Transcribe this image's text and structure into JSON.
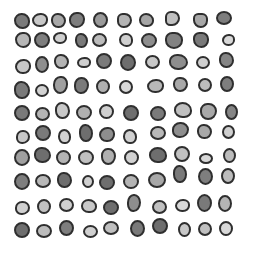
{
  "image": {
    "width": 253,
    "height": 256,
    "background": "#ffffff",
    "outline_color": "#2f2f2f",
    "description": "Grid of irregular rounded grayscale blobs with dark outlines"
  },
  "blobs": [
    {
      "x": 22,
      "y": 21,
      "w": 16,
      "h": 16,
      "fill": "#7a7a7a",
      "r": "48% 52% 45% 55%"
    },
    {
      "x": 40,
      "y": 20,
      "w": 16,
      "h": 14,
      "fill": "#c8c8c8",
      "r": "55% 45% 50% 50%"
    },
    {
      "x": 58,
      "y": 20,
      "w": 15,
      "h": 15,
      "fill": "#a8a8a8",
      "r": "45% 55% 50% 50%"
    },
    {
      "x": 77,
      "y": 20,
      "w": 16,
      "h": 16,
      "fill": "#7e7e7e",
      "r": "50% 45% 55% 50%"
    },
    {
      "x": 100,
      "y": 20,
      "w": 15,
      "h": 16,
      "fill": "#9a9a9a",
      "r": "50%"
    },
    {
      "x": 124,
      "y": 20,
      "w": 15,
      "h": 15,
      "fill": "#b4b4b4",
      "r": "40% 50% 55% 45%"
    },
    {
      "x": 146,
      "y": 20,
      "w": 15,
      "h": 14,
      "fill": "#a5a5a5",
      "r": "50% 55% 45% 50%"
    },
    {
      "x": 172,
      "y": 18,
      "w": 15,
      "h": 15,
      "fill": "#c0c0c0",
      "r": "45% 55% 60% 40%"
    },
    {
      "x": 200,
      "y": 20,
      "w": 15,
      "h": 15,
      "fill": "#a8a8a8",
      "r": "40% 45% 55% 60%"
    },
    {
      "x": 224,
      "y": 18,
      "w": 16,
      "h": 14,
      "fill": "#7d7d7d",
      "r": "50%"
    },
    {
      "x": 23,
      "y": 40,
      "w": 16,
      "h": 16,
      "fill": "#b6b6b6",
      "r": "50% 45% 50% 55%"
    },
    {
      "x": 42,
      "y": 40,
      "w": 16,
      "h": 16,
      "fill": "#7f7f7f",
      "r": "50%"
    },
    {
      "x": 60,
      "y": 38,
      "w": 14,
      "h": 12,
      "fill": "#cfcfcf",
      "r": "55% 45% 50% 50%"
    },
    {
      "x": 81,
      "y": 40,
      "w": 13,
      "h": 15,
      "fill": "#7a7a7a",
      "r": "45% 55% 50% 50%"
    },
    {
      "x": 99,
      "y": 40,
      "w": 15,
      "h": 14,
      "fill": "#bcbcbc",
      "r": "50%"
    },
    {
      "x": 126,
      "y": 40,
      "w": 14,
      "h": 14,
      "fill": "#d0d0d0",
      "r": "50% 50% 45% 55%"
    },
    {
      "x": 149,
      "y": 40,
      "w": 16,
      "h": 15,
      "fill": "#8e8e8e",
      "r": "50%"
    },
    {
      "x": 174,
      "y": 40,
      "w": 18,
      "h": 17,
      "fill": "#828282",
      "r": "40% 45% 50% 50%"
    },
    {
      "x": 201,
      "y": 40,
      "w": 16,
      "h": 16,
      "fill": "#7a7a7a",
      "r": "45% 50% 55% 60%"
    },
    {
      "x": 228,
      "y": 40,
      "w": 13,
      "h": 12,
      "fill": "#d8d8d8",
      "r": "55% 45% 50% 50%"
    },
    {
      "x": 23,
      "y": 66,
      "w": 16,
      "h": 15,
      "fill": "#c8c8c8",
      "r": "55% 45% 50% 50%"
    },
    {
      "x": 42,
      "y": 64,
      "w": 14,
      "h": 17,
      "fill": "#8e8e8e",
      "r": "50%"
    },
    {
      "x": 61,
      "y": 61,
      "w": 15,
      "h": 15,
      "fill": "#b4b4b4",
      "r": "45% 55% 50% 50%"
    },
    {
      "x": 84,
      "y": 62,
      "w": 14,
      "h": 11,
      "fill": "#cfcfcf",
      "r": "55% 45% 50% 50%"
    },
    {
      "x": 104,
      "y": 61,
      "w": 16,
      "h": 16,
      "fill": "#7a7a7a",
      "r": "50%"
    },
    {
      "x": 128,
      "y": 62,
      "w": 16,
      "h": 17,
      "fill": "#6e6e6e",
      "r": "50%"
    },
    {
      "x": 152,
      "y": 62,
      "w": 15,
      "h": 14,
      "fill": "#c8c8c8",
      "r": "50%"
    },
    {
      "x": 178,
      "y": 62,
      "w": 19,
      "h": 16,
      "fill": "#8e8e8e",
      "r": "45% 55% 50% 50%"
    },
    {
      "x": 203,
      "y": 62,
      "w": 14,
      "h": 13,
      "fill": "#cfcfcf",
      "r": "50%"
    },
    {
      "x": 226,
      "y": 60,
      "w": 15,
      "h": 16,
      "fill": "#858585",
      "r": "45% 55% 50% 50%"
    },
    {
      "x": 22,
      "y": 90,
      "w": 16,
      "h": 18,
      "fill": "#7a7a7a",
      "r": "45% 55% 50% 50%"
    },
    {
      "x": 42,
      "y": 90,
      "w": 14,
      "h": 13,
      "fill": "#d2d2d2",
      "r": "50%"
    },
    {
      "x": 60,
      "y": 85,
      "w": 15,
      "h": 18,
      "fill": "#a0a0a0",
      "r": "50% 45% 55% 50%"
    },
    {
      "x": 81,
      "y": 85,
      "w": 15,
      "h": 17,
      "fill": "#7a7a7a",
      "r": "50% 50% 55% 45%"
    },
    {
      "x": 103,
      "y": 86,
      "w": 14,
      "h": 15,
      "fill": "#b0b0b0",
      "r": "50%"
    },
    {
      "x": 126,
      "y": 87,
      "w": 14,
      "h": 14,
      "fill": "#d8d8d8",
      "r": "50%"
    },
    {
      "x": 155,
      "y": 86,
      "w": 17,
      "h": 14,
      "fill": "#b8b8b8",
      "r": "55% 45% 50% 50%"
    },
    {
      "x": 180,
      "y": 84,
      "w": 15,
      "h": 15,
      "fill": "#a8a8a8",
      "r": "45% 50% 55% 50%"
    },
    {
      "x": 205,
      "y": 85,
      "w": 14,
      "h": 14,
      "fill": "#bcbcbc",
      "r": "50%"
    },
    {
      "x": 227,
      "y": 84,
      "w": 14,
      "h": 16,
      "fill": "#7e7e7e",
      "r": "50%"
    },
    {
      "x": 22,
      "y": 113,
      "w": 16,
      "h": 16,
      "fill": "#7a7a7a",
      "r": "50%"
    },
    {
      "x": 42,
      "y": 114,
      "w": 15,
      "h": 14,
      "fill": "#b4b4b4",
      "r": "50%"
    },
    {
      "x": 62,
      "y": 110,
      "w": 15,
      "h": 17,
      "fill": "#c8c8c8",
      "r": "45% 55% 50% 50%"
    },
    {
      "x": 84,
      "y": 112,
      "w": 16,
      "h": 15,
      "fill": "#b0b0b0",
      "r": "50%"
    },
    {
      "x": 106,
      "y": 111,
      "w": 15,
      "h": 15,
      "fill": "#d0d0d0",
      "r": "50%"
    },
    {
      "x": 131,
      "y": 113,
      "w": 16,
      "h": 16,
      "fill": "#6e6e6e",
      "r": "50%"
    },
    {
      "x": 158,
      "y": 113,
      "w": 16,
      "h": 15,
      "fill": "#7a7a7a",
      "r": "50%"
    },
    {
      "x": 183,
      "y": 110,
      "w": 18,
      "h": 16,
      "fill": "#c0c0c0",
      "r": "50% 55% 45% 50%"
    },
    {
      "x": 208,
      "y": 111,
      "w": 17,
      "h": 17,
      "fill": "#a8a8a8",
      "r": "45% 50% 55% 50%"
    },
    {
      "x": 231,
      "y": 112,
      "w": 13,
      "h": 16,
      "fill": "#858585",
      "r": "50%"
    },
    {
      "x": 23,
      "y": 137,
      "w": 14,
      "h": 14,
      "fill": "#c8c8c8",
      "r": "50% 50% 55% 45%"
    },
    {
      "x": 43,
      "y": 133,
      "w": 16,
      "h": 16,
      "fill": "#7a7a7a",
      "r": "50%"
    },
    {
      "x": 64,
      "y": 136,
      "w": 13,
      "h": 15,
      "fill": "#d2d2d2",
      "r": "50% 55% 45% 50%"
    },
    {
      "x": 86,
      "y": 133,
      "w": 14,
      "h": 18,
      "fill": "#6e6e6e",
      "r": "45% 55% 50% 50%"
    },
    {
      "x": 107,
      "y": 134,
      "w": 16,
      "h": 15,
      "fill": "#8e8e8e",
      "r": "55% 45% 50% 50%"
    },
    {
      "x": 130,
      "y": 136,
      "w": 14,
      "h": 15,
      "fill": "#d0d0d0",
      "r": "50% 55% 45% 50%"
    },
    {
      "x": 158,
      "y": 133,
      "w": 16,
      "h": 14,
      "fill": "#b8b8b8",
      "r": "50%"
    },
    {
      "x": 180,
      "y": 130,
      "w": 17,
      "h": 16,
      "fill": "#8e8e8e",
      "r": "50% 50% 55% 45%"
    },
    {
      "x": 204,
      "y": 131,
      "w": 15,
      "h": 15,
      "fill": "#a8a8a8",
      "r": "45% 55% 50% 50%"
    },
    {
      "x": 228,
      "y": 132,
      "w": 13,
      "h": 14,
      "fill": "#cfcfcf",
      "r": "50%"
    },
    {
      "x": 22,
      "y": 157,
      "w": 16,
      "h": 17,
      "fill": "#a0a0a0",
      "r": "50%"
    },
    {
      "x": 42,
      "y": 155,
      "w": 17,
      "h": 16,
      "fill": "#6e6e6e",
      "r": "45% 55% 50% 50%"
    },
    {
      "x": 63,
      "y": 157,
      "w": 15,
      "h": 15,
      "fill": "#b4b4b4",
      "r": "50%"
    },
    {
      "x": 86,
      "y": 157,
      "w": 16,
      "h": 15,
      "fill": "#c0c0c0",
      "r": "50%"
    },
    {
      "x": 108,
      "y": 156,
      "w": 15,
      "h": 17,
      "fill": "#b0b0b0",
      "r": "45% 50% 55% 50%"
    },
    {
      "x": 131,
      "y": 157,
      "w": 15,
      "h": 15,
      "fill": "#d2d2d2",
      "r": "50%"
    },
    {
      "x": 158,
      "y": 155,
      "w": 18,
      "h": 16,
      "fill": "#6e6e6e",
      "r": "50% 55% 45% 50%"
    },
    {
      "x": 182,
      "y": 154,
      "w": 16,
      "h": 16,
      "fill": "#c0c0c0",
      "r": "50%"
    },
    {
      "x": 206,
      "y": 158,
      "w": 14,
      "h": 11,
      "fill": "#d8d8d8",
      "r": "50%"
    },
    {
      "x": 229,
      "y": 155,
      "w": 13,
      "h": 15,
      "fill": "#bcbcbc",
      "r": "50%"
    },
    {
      "x": 22,
      "y": 181,
      "w": 16,
      "h": 17,
      "fill": "#7e7e7e",
      "r": "50%"
    },
    {
      "x": 43,
      "y": 181,
      "w": 16,
      "h": 14,
      "fill": "#b8b8b8",
      "r": "50%"
    },
    {
      "x": 64,
      "y": 180,
      "w": 15,
      "h": 16,
      "fill": "#6e6e6e",
      "r": "45% 55% 50% 50%"
    },
    {
      "x": 88,
      "y": 181,
      "w": 12,
      "h": 13,
      "fill": "#d0d0d0",
      "r": "50%"
    },
    {
      "x": 107,
      "y": 182,
      "w": 16,
      "h": 15,
      "fill": "#6e6e6e",
      "r": "50%"
    },
    {
      "x": 131,
      "y": 181,
      "w": 16,
      "h": 15,
      "fill": "#b4b4b4",
      "r": "50%"
    },
    {
      "x": 157,
      "y": 180,
      "w": 18,
      "h": 16,
      "fill": "#a8a8a8",
      "r": "50%"
    },
    {
      "x": 180,
      "y": 174,
      "w": 14,
      "h": 18,
      "fill": "#7a7a7a",
      "r": "45% 55% 50% 50%"
    },
    {
      "x": 205,
      "y": 176,
      "w": 15,
      "h": 17,
      "fill": "#7e7e7e",
      "r": "50%"
    },
    {
      "x": 228,
      "y": 176,
      "w": 14,
      "h": 16,
      "fill": "#bcbcbc",
      "r": "50%"
    },
    {
      "x": 22,
      "y": 208,
      "w": 15,
      "h": 14,
      "fill": "#d0d0d0",
      "r": "50% 50% 55% 45%"
    },
    {
      "x": 44,
      "y": 206,
      "w": 14,
      "h": 15,
      "fill": "#c0c0c0",
      "r": "50%"
    },
    {
      "x": 66,
      "y": 205,
      "w": 15,
      "h": 14,
      "fill": "#cfcfcf",
      "r": "50%"
    },
    {
      "x": 89,
      "y": 206,
      "w": 16,
      "h": 14,
      "fill": "#c8c8c8",
      "r": "50% 55% 45% 50%"
    },
    {
      "x": 111,
      "y": 207,
      "w": 16,
      "h": 15,
      "fill": "#6e6e6e",
      "r": "50%"
    },
    {
      "x": 134,
      "y": 203,
      "w": 14,
      "h": 18,
      "fill": "#8e8e8e",
      "r": "50% 50% 55% 45%"
    },
    {
      "x": 159,
      "y": 207,
      "w": 15,
      "h": 14,
      "fill": "#c0c0c0",
      "r": "50%"
    },
    {
      "x": 182,
      "y": 205,
      "w": 15,
      "h": 13,
      "fill": "#d8d8d8",
      "r": "55% 45% 50% 50%"
    },
    {
      "x": 204,
      "y": 203,
      "w": 15,
      "h": 18,
      "fill": "#7a7a7a",
      "r": "50%"
    },
    {
      "x": 225,
      "y": 203,
      "w": 14,
      "h": 17,
      "fill": "#b4b4b4",
      "r": "50%"
    },
    {
      "x": 22,
      "y": 230,
      "w": 16,
      "h": 16,
      "fill": "#6e6e6e",
      "r": "50%"
    },
    {
      "x": 44,
      "y": 231,
      "w": 16,
      "h": 14,
      "fill": "#bcbcbc",
      "r": "50%"
    },
    {
      "x": 66,
      "y": 228,
      "w": 15,
      "h": 16,
      "fill": "#7e7e7e",
      "r": "50%"
    },
    {
      "x": 90,
      "y": 231,
      "w": 15,
      "h": 13,
      "fill": "#d0d0d0",
      "r": "50%"
    },
    {
      "x": 111,
      "y": 228,
      "w": 16,
      "h": 14,
      "fill": "#c0c0c0",
      "r": "50%"
    },
    {
      "x": 137,
      "y": 228,
      "w": 15,
      "h": 17,
      "fill": "#7a7a7a",
      "r": "50%"
    },
    {
      "x": 160,
      "y": 226,
      "w": 16,
      "h": 16,
      "fill": "#6e6e6e",
      "r": "50%"
    },
    {
      "x": 184,
      "y": 229,
      "w": 13,
      "h": 15,
      "fill": "#c8c8c8",
      "r": "50%"
    },
    {
      "x": 205,
      "y": 229,
      "w": 14,
      "h": 14,
      "fill": "#c0c0c0",
      "r": "50%"
    },
    {
      "x": 226,
      "y": 228,
      "w": 14,
      "h": 15,
      "fill": "#d8d8d8",
      "r": "50%"
    }
  ]
}
